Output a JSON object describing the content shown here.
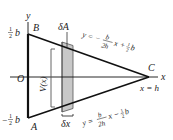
{
  "diagram": {
    "type": "triangle-cross-section",
    "axes": {
      "x_label": "x",
      "y_label": "y",
      "origin_label": "O"
    },
    "vertices": {
      "A": {
        "label": "A",
        "coords": "(0, -1/2 b)"
      },
      "B": {
        "label": "B",
        "coords": "(0, 1/2 b)"
      },
      "C": {
        "label": "C",
        "coords": "(h, 0)"
      }
    },
    "y_ticks": {
      "top": {
        "sign": "",
        "frac_num": "1",
        "frac_den": "2",
        "var": "b"
      },
      "bottom": {
        "sign": "−",
        "frac_num": "1",
        "frac_den": "2",
        "var": "b"
      }
    },
    "upper_edge_equation": {
      "lhs": "y = −",
      "frac_num": "b",
      "frac_den": "2h",
      "rest": "x +",
      "c_num": "1",
      "c_den": "2",
      "c_var": "b"
    },
    "lower_edge_equation": {
      "lhs": "y =",
      "frac_num": "b",
      "frac_den": "2h",
      "rest": "x −",
      "c_num": "1",
      "c_den": "2",
      "c_var": "b"
    },
    "x_end_label": "x = h",
    "strip_area_label": "δA",
    "strip_width_label": "δx",
    "height_label": "V(x)",
    "colors": {
      "line": "#111111",
      "strip_fill": "#c8c8c8",
      "bracket": "#555555"
    }
  }
}
